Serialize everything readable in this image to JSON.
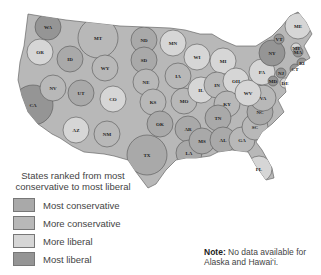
{
  "map": {
    "colors": {
      "most_conservative": "#a9a9a9",
      "more_conservative": "#b8b8b8",
      "more_liberal": "#d6d6d6",
      "most_liberal": "#959595"
    },
    "states": [
      {
        "abbr": "WA",
        "cat": "most_liberal",
        "x": 48,
        "y": 27
      },
      {
        "abbr": "OR",
        "cat": "more_liberal",
        "x": 40,
        "y": 52
      },
      {
        "abbr": "CA",
        "cat": "most_liberal",
        "x": 33,
        "y": 105
      },
      {
        "abbr": "NV",
        "cat": "more_conservative",
        "x": 53,
        "y": 88
      },
      {
        "abbr": "ID",
        "cat": "most_conservative",
        "x": 70,
        "y": 59
      },
      {
        "abbr": "MT",
        "cat": "more_conservative",
        "x": 98,
        "y": 38
      },
      {
        "abbr": "WY",
        "cat": "more_conservative",
        "x": 105,
        "y": 68
      },
      {
        "abbr": "UT",
        "cat": "most_conservative",
        "x": 81,
        "y": 93
      },
      {
        "abbr": "CO",
        "cat": "more_liberal",
        "x": 113,
        "y": 99
      },
      {
        "abbr": "AZ",
        "cat": "more_liberal",
        "x": 76,
        "y": 130
      },
      {
        "abbr": "NM",
        "cat": "more_conservative",
        "x": 107,
        "y": 134
      },
      {
        "abbr": "ND",
        "cat": "most_conservative",
        "x": 144,
        "y": 40
      },
      {
        "abbr": "SD",
        "cat": "most_conservative",
        "x": 144,
        "y": 60
      },
      {
        "abbr": "NE",
        "cat": "more_conservative",
        "x": 146,
        "y": 82
      },
      {
        "abbr": "KS",
        "cat": "more_conservative",
        "x": 153,
        "y": 102
      },
      {
        "abbr": "OK",
        "cat": "most_conservative",
        "x": 160,
        "y": 124
      },
      {
        "abbr": "TX",
        "cat": "most_conservative",
        "x": 147,
        "y": 155
      },
      {
        "abbr": "MN",
        "cat": "more_liberal",
        "x": 173,
        "y": 43
      },
      {
        "abbr": "IA",
        "cat": "more_conservative",
        "x": 178,
        "y": 76
      },
      {
        "abbr": "MO",
        "cat": "more_conservative",
        "x": 184,
        "y": 101
      },
      {
        "abbr": "AR",
        "cat": "most_conservative",
        "x": 188,
        "y": 129
      },
      {
        "abbr": "LA",
        "cat": "most_conservative",
        "x": 189,
        "y": 153
      },
      {
        "abbr": "WI",
        "cat": "more_liberal",
        "x": 197,
        "y": 57
      },
      {
        "abbr": "IL",
        "cat": "more_liberal",
        "x": 201,
        "y": 90
      },
      {
        "abbr": "MI",
        "cat": "more_liberal",
        "x": 223,
        "y": 61
      },
      {
        "abbr": "IN",
        "cat": "more_conservative",
        "x": 217,
        "y": 85
      },
      {
        "abbr": "OH",
        "cat": "more_liberal",
        "x": 236,
        "y": 81
      },
      {
        "abbr": "KY",
        "cat": "more_conservative",
        "x": 227,
        "y": 104
      },
      {
        "abbr": "TN",
        "cat": "most_conservative",
        "x": 218,
        "y": 118
      },
      {
        "abbr": "MS",
        "cat": "most_conservative",
        "x": 202,
        "y": 141
      },
      {
        "abbr": "AL",
        "cat": "most_conservative",
        "x": 223,
        "y": 140
      },
      {
        "abbr": "GA",
        "cat": "more_conservative",
        "x": 242,
        "y": 140
      },
      {
        "abbr": "FL",
        "cat": "more_liberal",
        "x": 259,
        "y": 169
      },
      {
        "abbr": "SC",
        "cat": "more_conservative",
        "x": 255,
        "y": 127
      },
      {
        "abbr": "NC",
        "cat": "most_conservative",
        "x": 260,
        "y": 112
      },
      {
        "abbr": "VA",
        "cat": "more_conservative",
        "x": 263,
        "y": 98
      },
      {
        "abbr": "WV",
        "cat": "more_liberal",
        "x": 248,
        "y": 93
      },
      {
        "abbr": "PA",
        "cat": "more_liberal",
        "x": 262,
        "y": 72
      },
      {
        "abbr": "NY",
        "cat": "most_liberal",
        "x": 272,
        "y": 53
      },
      {
        "abbr": "VT",
        "cat": "most_liberal",
        "x": 279,
        "y": 39
      },
      {
        "abbr": "NH",
        "cat": "more_liberal",
        "x": 296,
        "y": 48
      },
      {
        "abbr": "ME",
        "cat": "more_liberal",
        "x": 298,
        "y": 26
      },
      {
        "abbr": "MA",
        "cat": "most_liberal",
        "x": 298,
        "y": 52
      },
      {
        "abbr": "RI",
        "cat": "most_liberal",
        "x": 302,
        "y": 63
      },
      {
        "abbr": "CT",
        "cat": "most_liberal",
        "x": 295,
        "y": 69
      },
      {
        "abbr": "NJ",
        "cat": "most_liberal",
        "x": 281,
        "y": 73
      },
      {
        "abbr": "DE",
        "cat": "more_liberal",
        "x": 285,
        "y": 83
      },
      {
        "abbr": "MD",
        "cat": "most_liberal",
        "x": 273,
        "y": 81
      }
    ]
  },
  "legend": {
    "title": "States ranked from most conservative to most liberal",
    "items": [
      {
        "label": "Most conservative",
        "color": "#a9a9a9"
      },
      {
        "label": "More conservative",
        "color": "#b8b8b8"
      },
      {
        "label": "More liberal",
        "color": "#d6d6d6"
      },
      {
        "label": "Most liberal",
        "color": "#959595"
      }
    ]
  },
  "note": {
    "bold": "Note:",
    "text": " No data available for Alaska and Hawai‘i."
  }
}
